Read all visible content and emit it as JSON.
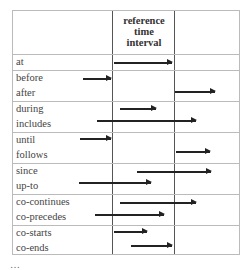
{
  "header": {
    "line1": "reference",
    "line2": "time",
    "line3": "interval"
  },
  "rows": [
    {
      "labels": [
        "at"
      ]
    },
    {
      "labels": [
        "before",
        "after"
      ]
    },
    {
      "labels": [
        "during",
        "includes"
      ]
    },
    {
      "labels": [
        "until",
        "follows"
      ]
    },
    {
      "labels": [
        "since",
        "up-to"
      ]
    },
    {
      "labels": [
        "co-continues",
        "co-precedes"
      ]
    },
    {
      "labels": [
        "co-starts",
        "co-ends"
      ]
    }
  ],
  "caption": "…"
}
